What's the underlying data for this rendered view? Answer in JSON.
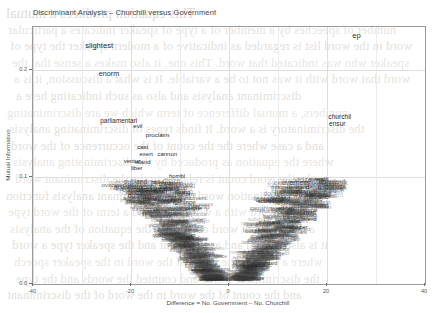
{
  "figure": {
    "title": "Discriminant Analysis – Churchill versus Government",
    "xlabel": "Difference = No. Government – No. Churchill",
    "ylabel": "Mutual Information"
  },
  "background_document": {
    "note": "faint bleed-through text from the reverse of the scanned page",
    "lines": [
      "This equation produces a mutual",
      "number of speeches by a member of a type of speaker indicates a particular",
      "word in the word list is regarded as indicative of a modern speaker the type of",
      "speaker who was indicated that word.  This one, it also makes a sense that the",
      "word that word with it was not to be a variable.  It is what a discussion, it is a",
      "discriminant analysis and also as such indicating here a",
      "numbers, a mutual difference of term which we are discriminating",
      "the discriminatory is a word.  It finds types of discriminating analysis",
      "and a case where the the count of the occurrence of the word",
      "where the equation as produced by the discriminating analysis",
      "to the the word count is relative to the the discriminant word",
      "the discrimination word of the discriminant analysis function",
      "of the word with a word count and a term of the word type",
      "a discriminant word counted in the equation of the analysis",
      "it is also a word and as the count and the speaker type a word",
      "where a word is the count of the word in the speaker speech",
      "the discriminant words and counted the words and the type",
      "and the count of the word in the word of the discriminant"
    ]
  },
  "chart_data": {
    "type": "scatter",
    "title": "Discriminant Analysis – Churchill versus Government",
    "xlabel": "Difference = No. Government – No. Churchill",
    "ylabel": "Mutual Information",
    "xlim": [
      -40,
      40
    ],
    "ylim": [
      0.0,
      0.24
    ],
    "xticks": [
      -40,
      -20,
      0,
      20,
      40
    ],
    "xticklabels": [
      "-40",
      "-20",
      "0",
      "20",
      "40"
    ],
    "yticks": [
      0.0,
      0.1,
      0.2
    ],
    "yticklabels": [
      "0.0",
      "0.1",
      "0.2"
    ],
    "grid": true,
    "legend": "none",
    "marker": "text-labels",
    "points": [
      {
        "label": "slightest",
        "x": -26.5,
        "y": 0.222,
        "size": 7.6
      },
      {
        "label": "enorm",
        "x": -24.5,
        "y": 0.196,
        "size": 7.2
      },
      {
        "label": "ep",
        "x": 26.0,
        "y": 0.232,
        "size": 7.6
      },
      {
        "label": "churchil",
        "x": 22.6,
        "y": 0.156,
        "size": 6.6
      },
      {
        "label": "ensur",
        "x": 22.1,
        "y": 0.149,
        "size": 6.6
      },
      {
        "label": "parliamentari",
        "x": -22.5,
        "y": 0.152,
        "size": 6.4
      },
      {
        "label": "evil",
        "x": -18.6,
        "y": 0.148,
        "size": 6.2
      },
      {
        "label": "proclaim",
        "x": -14.6,
        "y": 0.139,
        "size": 6.2
      },
      {
        "label": "cast",
        "x": -17.6,
        "y": 0.128,
        "size": 6.0
      },
      {
        "label": "exert",
        "x": -16.9,
        "y": 0.121,
        "size": 6.0
      },
      {
        "label": "cannon",
        "x": -12.6,
        "y": 0.121,
        "size": 6.0
      },
      {
        "label": "ventur",
        "x": -19.8,
        "y": 0.115,
        "size": 6.0
      },
      {
        "label": "island",
        "x": -17.6,
        "y": 0.114,
        "size": 6.0
      },
      {
        "label": "liber",
        "x": -18.8,
        "y": 0.108,
        "size": 6.0
      },
      {
        "label": "horribl",
        "x": -10.6,
        "y": 0.1,
        "size": 5.8
      },
      {
        "label": "rapid",
        "x": -14.6,
        "y": 0.094,
        "size": 5.6
      },
      {
        "label": "gradu",
        "x": -12.9,
        "y": 0.093,
        "size": 5.6
      },
      {
        "label": "unitedst",
        "x": -16.8,
        "y": 0.087,
        "size": 5.8
      },
      {
        "label": "finish",
        "x": -14.0,
        "y": 0.086,
        "size": 5.6
      },
      {
        "label": "strang",
        "x": -9.5,
        "y": 0.085,
        "size": 5.6
      },
      {
        "label": "prime",
        "x": -16.2,
        "y": 0.078,
        "size": 5.4
      },
      {
        "label": "burden",
        "x": -12.7,
        "y": 0.077,
        "size": 5.4
      },
      {
        "label": "explos",
        "x": -10.4,
        "y": 0.078,
        "size": 5.4
      },
      {
        "label": "misunderstand",
        "x": 12.5,
        "y": 0.09,
        "size": 5.8
      },
      {
        "label": "approv",
        "x": 18.1,
        "y": 0.083,
        "size": 5.8
      },
      {
        "label": "overal",
        "x": 18.0,
        "y": 0.097,
        "size": 5.8
      },
      {
        "label": "result",
        "x": 18.9,
        "y": 0.097,
        "size": 5.8
      },
      {
        "label": "accept",
        "x": 7.5,
        "y": 0.077,
        "size": 5.4
      },
      {
        "label": "april",
        "x": 10.1,
        "y": 0.077,
        "size": 5.4
      },
      {
        "label": "entrap",
        "x": 11.6,
        "y": 0.07,
        "size": 5.4
      },
      {
        "label": "invad",
        "x": 16.4,
        "y": 0.066,
        "size": 5.4
      },
      {
        "label": "defend",
        "x": 16.2,
        "y": 0.06,
        "size": 5.4
      },
      {
        "label": "relief",
        "x": 13.4,
        "y": 0.058,
        "size": 5.2
      },
      {
        "label": "submarin",
        "x": 8.2,
        "y": 0.057,
        "size": 5.2
      },
      {
        "label": "bomber",
        "x": 14.2,
        "y": 0.052,
        "size": 5.2
      }
    ],
    "dense_cloud": {
      "description": "unlabelled-in-overview mass of overlapping word labels forming the V funnel",
      "approx_word_count": 900,
      "x_range": [
        -22,
        22
      ],
      "y_range": [
        0.0,
        0.09
      ]
    }
  }
}
